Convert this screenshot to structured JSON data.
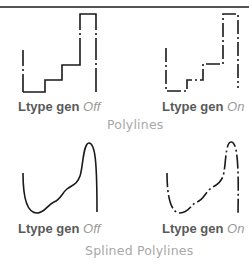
{
  "figure": {
    "sections": [
      {
        "title": "Polylines",
        "panels": [
          {
            "label": "Ltype gen",
            "state": "Off",
            "linetype": "dash-dot",
            "dashes_across_vertices": false
          },
          {
            "label": "Ltype gen",
            "state": "On",
            "linetype": "dash-dot",
            "dashes_across_vertices": true
          }
        ]
      },
      {
        "title": "Splined Polylines",
        "panels": [
          {
            "label": "Ltype gen",
            "state": "Off",
            "linetype": "dash-dot",
            "dashes_across_vertices": false
          },
          {
            "label": "Ltype gen",
            "state": "On",
            "linetype": "dash-dot",
            "dashes_across_vertices": true
          }
        ]
      }
    ],
    "colors": {
      "stroke": "#1a1a1a",
      "label_key": "#5a5a5a",
      "label_value": "#9a9a9a",
      "section_title": "#a8a8a8",
      "top_rule": "#555555"
    }
  }
}
